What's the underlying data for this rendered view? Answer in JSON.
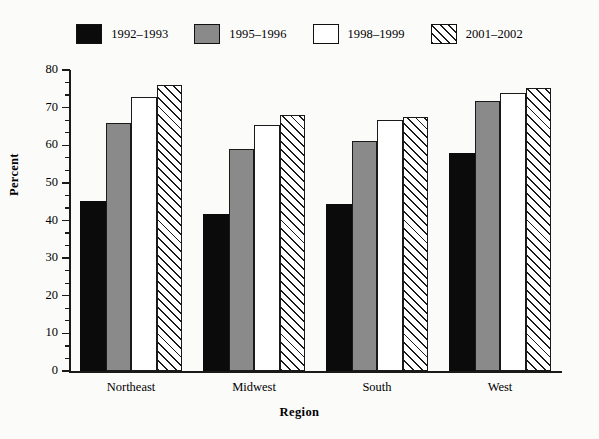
{
  "chart_data": {
    "type": "bar",
    "title": "",
    "subtitle": "",
    "xlabel": "Region",
    "ylabel": "Percent",
    "categories": [
      "Northeast",
      "Midwest",
      "South",
      "West"
    ],
    "ylim": [
      0,
      80
    ],
    "ytick_step": 10,
    "yticks": [
      "0",
      "10",
      "20",
      "30",
      "40",
      "50",
      "60",
      "70",
      "80"
    ],
    "minor_ticks_per_interval": 2,
    "grid": false,
    "legend_position": "top-center",
    "series": [
      {
        "name": "1992–1993",
        "fill": "solid-black",
        "color": "#0b0b0b",
        "values": [
          45.3,
          41.7,
          44.5,
          58.0
        ]
      },
      {
        "name": "1995–1996",
        "fill": "solid-gray",
        "color": "#8a8a8a",
        "values": [
          66.0,
          59.0,
          61.2,
          71.8
        ]
      },
      {
        "name": "1998–1999",
        "fill": "white",
        "color": "#ffffff",
        "values": [
          72.8,
          65.5,
          66.8,
          74.0
        ]
      },
      {
        "name": "2001–2002",
        "fill": "diagonal-hatch",
        "color": "#ffffff",
        "values": [
          76.0,
          68.0,
          67.5,
          75.3
        ]
      }
    ]
  },
  "figure": {
    "background_color": "#fbfbfa",
    "axis_color": "#1a1a1a"
  }
}
